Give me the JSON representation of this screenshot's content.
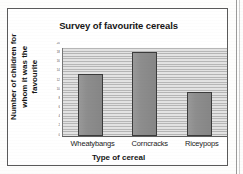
{
  "chart_data": {
    "type": "bar",
    "title": "Survey of favourite cereals",
    "xlabel": "Type of cereal",
    "ylabel": "Number of children for whom it was the favourite",
    "categories": [
      "Wheatybangs",
      "Corncracks",
      "Riceypops"
    ],
    "values": [
      14,
      19,
      10
    ],
    "ylim": [
      0,
      20
    ],
    "yticks": [
      0,
      2,
      4,
      6,
      8,
      10,
      12,
      14,
      16,
      18,
      20
    ],
    "ytick_labels": [
      "20",
      "18",
      "16",
      "14",
      "12",
      "10",
      "8",
      "6",
      "4",
      "2",
      "0"
    ],
    "grid": true,
    "legend": false,
    "legend_position": "none",
    "bar_color": "#8d8d8d",
    "bar_edge_color": "#3b3b3b",
    "plot_background_color": "#d4d4d4",
    "gridline_color": "#b6b6b6",
    "frame_color": "#5a5a5a",
    "note": "Scanned grayscale worksheet chart; y-axis tick numbers are too small to read in the scan."
  },
  "chart": {
    "title": "Survey of favourite cereals",
    "y_axis_title": "Number of children for whom it was the favourite",
    "x_axis_title": "Type of cereal"
  }
}
